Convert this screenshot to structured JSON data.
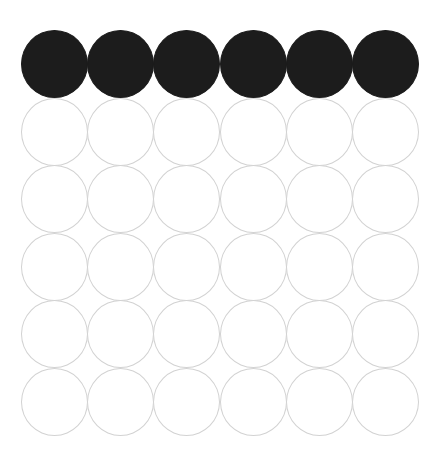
{
  "grid": {
    "rows": 6,
    "cols": 6,
    "origin": {
      "x": 21,
      "y": 30
    },
    "pitch": {
      "x": 66.2,
      "y": 67.6
    },
    "diameter": {
      "x": 67,
      "y": 68
    },
    "colors": {
      "filled": "#1c1c1c",
      "empty_outline": "#d2d2d2",
      "background": "#ffffff"
    },
    "cells": [
      [
        1,
        1,
        1,
        1,
        1,
        1
      ],
      [
        0,
        0,
        0,
        0,
        0,
        0
      ],
      [
        0,
        0,
        0,
        0,
        0,
        0
      ],
      [
        0,
        0,
        0,
        0,
        0,
        0
      ],
      [
        0,
        0,
        0,
        0,
        0,
        0
      ],
      [
        0,
        0,
        0,
        0,
        0,
        0
      ]
    ]
  }
}
